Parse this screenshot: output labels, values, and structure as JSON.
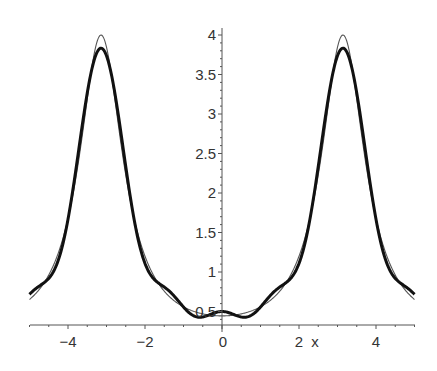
{
  "chart_data": {
    "type": "line",
    "title": "",
    "xlabel": "x",
    "ylabel": "",
    "xlim": [
      -5,
      5
    ],
    "ylim": [
      0.33,
      4.0
    ],
    "grid": false,
    "legend": null,
    "x_ticks": [
      {
        "value": -4,
        "label": "−4"
      },
      {
        "value": -2,
        "label": "−2"
      },
      {
        "value": 0,
        "label": "0"
      },
      {
        "value": 2,
        "label": "2"
      },
      {
        "value": 4,
        "label": "4"
      }
    ],
    "y_ticks": [
      {
        "value": 0.5,
        "label": "0.5"
      },
      {
        "value": 1,
        "label": "1"
      },
      {
        "value": 1.5,
        "label": "1.5"
      },
      {
        "value": 2,
        "label": "2"
      },
      {
        "value": 2.5,
        "label": "2.5"
      },
      {
        "value": 3,
        "label": "3"
      },
      {
        "value": 3.5,
        "label": "3.5"
      },
      {
        "value": 4,
        "label": "4"
      }
    ],
    "series": [
      {
        "name": "f(x) = 1/(1.25 + cos x)",
        "style": "thin",
        "color": "#555555",
        "x": [
          -5,
          -4,
          -3.1416,
          -2,
          -1,
          0,
          1,
          2,
          3.1416,
          4,
          5
        ],
        "values": [
          0.652,
          1.666,
          4.0,
          1.2,
          0.558,
          0.444,
          0.558,
          1.2,
          4.0,
          1.666,
          0.652
        ]
      },
      {
        "name": "Fourier partial sum (n = 4)",
        "style": "thick",
        "color": "#111111",
        "x": [
          -5,
          -4,
          -3.1416,
          -2,
          -1,
          0,
          1,
          2,
          3.1416,
          4,
          5
        ],
        "values": [
          0.68,
          1.62,
          3.833,
          1.19,
          0.48,
          0.5,
          0.48,
          1.19,
          3.833,
          1.62,
          0.68
        ]
      }
    ]
  }
}
